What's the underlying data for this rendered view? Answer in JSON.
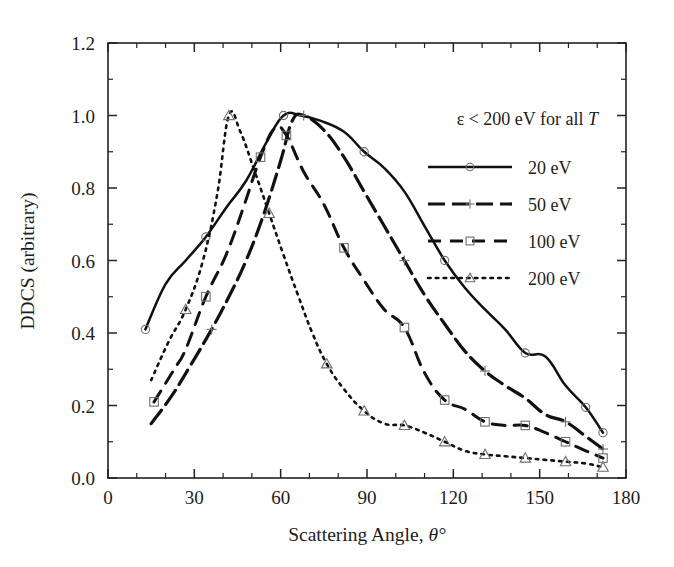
{
  "chart_data": {
    "type": "line",
    "title": "",
    "xlabel": "Scattering Angle, θ°",
    "ylabel": "DDCS (arbitrary)",
    "xlim": [
      0,
      180
    ],
    "ylim": [
      0.0,
      1.2
    ],
    "xticks": [
      0,
      30,
      60,
      90,
      120,
      150,
      180
    ],
    "xtick_labels": [
      "0",
      "30",
      "60",
      "90",
      "120",
      "150",
      "180"
    ],
    "yticks": [
      0.0,
      0.2,
      0.4,
      0.6,
      0.8,
      1.0,
      1.2
    ],
    "ytick_labels": [
      "0.0",
      "0.2",
      "0.4",
      "0.6",
      "0.8",
      "1.0",
      "1.2"
    ],
    "x_minor_step": 10,
    "y_minor_step": 0.1,
    "grid": false,
    "legend_position": "upper-right-inside",
    "annotation": "ε < 200 eV for all T",
    "annotation_plain": "epsilon < 200 eV for all T",
    "series": [
      {
        "name": "20 eV",
        "label": "20 eV",
        "linestyle": "solid",
        "marker": "circle",
        "color": "#111111",
        "x": [
          13,
          20,
          27,
          34,
          41,
          48,
          55,
          61,
          67,
          74,
          82,
          89,
          96,
          103,
          110,
          117,
          124,
          131,
          138,
          145,
          152,
          159,
          166,
          172
        ],
        "y": [
          0.41,
          0.535,
          0.6,
          0.665,
          0.745,
          0.82,
          0.925,
          1.0,
          1.0,
          0.985,
          0.955,
          0.9,
          0.855,
          0.79,
          0.695,
          0.6,
          0.525,
          0.465,
          0.41,
          0.345,
          0.335,
          0.255,
          0.195,
          0.125
        ],
        "marker_x": [
          13,
          34,
          61,
          89,
          117,
          145,
          166,
          172
        ],
        "marker_y": [
          0.41,
          0.665,
          1.0,
          0.9,
          0.6,
          0.345,
          0.195,
          0.125
        ]
      },
      {
        "name": "50 eV",
        "label": "50 eV",
        "linestyle": "dashdot",
        "marker": "plus",
        "color": "#111111",
        "x": [
          15,
          22,
          29,
          36,
          42,
          48,
          54,
          60,
          64,
          68,
          75,
          82,
          89,
          96,
          103,
          110,
          117,
          124,
          131,
          138,
          145,
          152,
          159,
          166,
          172
        ],
        "y": [
          0.15,
          0.225,
          0.315,
          0.41,
          0.5,
          0.6,
          0.725,
          0.875,
          0.985,
          1.0,
          0.96,
          0.885,
          0.79,
          0.695,
          0.6,
          0.505,
          0.425,
          0.35,
          0.295,
          0.255,
          0.22,
          0.175,
          0.155,
          0.115,
          0.08
        ],
        "marker_x": [
          36,
          68,
          103,
          131,
          159,
          172
        ],
        "marker_y": [
          0.41,
          1.0,
          0.6,
          0.295,
          0.155,
          0.08
        ]
      },
      {
        "name": "100 eV",
        "label": "100 eV",
        "linestyle": "dashed",
        "marker": "square",
        "color": "#111111",
        "x": [
          16,
          23,
          27,
          34,
          41,
          47,
          53,
          58,
          62,
          68,
          75,
          82,
          89,
          96,
          103,
          110,
          117,
          124,
          131,
          138,
          145,
          152,
          159,
          166,
          172
        ],
        "y": [
          0.21,
          0.3,
          0.355,
          0.5,
          0.615,
          0.745,
          0.885,
          0.965,
          0.945,
          0.845,
          0.755,
          0.635,
          0.545,
          0.465,
          0.415,
          0.29,
          0.215,
          0.19,
          0.155,
          0.145,
          0.145,
          0.125,
          0.1,
          0.075,
          0.055
        ],
        "marker_x": [
          16,
          34,
          53,
          62,
          82,
          103,
          117,
          131,
          145,
          159,
          172
        ],
        "marker_y": [
          0.21,
          0.5,
          0.885,
          0.945,
          0.635,
          0.415,
          0.215,
          0.155,
          0.145,
          0.1,
          0.055
        ]
      },
      {
        "name": "200 eV",
        "label": "200 eV",
        "linestyle": "dotted",
        "marker": "triangle",
        "color": "#111111",
        "x": [
          15,
          21,
          27,
          33,
          38,
          42,
          46,
          51,
          56,
          61,
          66,
          71,
          76,
          82,
          89,
          96,
          103,
          110,
          117,
          124,
          131,
          138,
          145,
          152,
          159,
          166,
          172
        ],
        "y": [
          0.27,
          0.375,
          0.465,
          0.6,
          0.785,
          1.0,
          0.955,
          0.845,
          0.73,
          0.615,
          0.505,
          0.4,
          0.315,
          0.245,
          0.185,
          0.15,
          0.145,
          0.125,
          0.1,
          0.075,
          0.065,
          0.06,
          0.055,
          0.05,
          0.045,
          0.04,
          0.03
        ],
        "marker_x": [
          27,
          42,
          56,
          76,
          89,
          103,
          117,
          131,
          145,
          159,
          172
        ],
        "marker_y": [
          0.465,
          1.0,
          0.73,
          0.315,
          0.185,
          0.145,
          0.1,
          0.065,
          0.055,
          0.045,
          0.03
        ]
      }
    ]
  },
  "axes": {
    "x_title": "Scattering Angle, θ°",
    "x_title_prefix": "Scattering Angle, ",
    "x_title_symbol": "θ°",
    "y_title": "DDCS (arbitrary)"
  },
  "legend": {
    "note_prefix": "ε < 200 eV for all ",
    "note_italic": "T",
    "entries": [
      {
        "label": "20 eV",
        "style": "solid",
        "marker": "circle"
      },
      {
        "label": "50 eV",
        "style": "dashdot",
        "marker": "plus"
      },
      {
        "label": "100 eV",
        "style": "dashed",
        "marker": "square"
      },
      {
        "label": "200 eV",
        "style": "dotted",
        "marker": "triangle"
      }
    ]
  },
  "ticks": {
    "x": [
      "0",
      "30",
      "60",
      "90",
      "120",
      "150",
      "180"
    ],
    "y": [
      "0.0",
      "0.2",
      "0.4",
      "0.6",
      "0.8",
      "1.0",
      "1.2"
    ]
  },
  "colors": {
    "line": "#111111",
    "marker": "#6e6e6e",
    "axis": "#222222",
    "background": "#ffffff"
  }
}
